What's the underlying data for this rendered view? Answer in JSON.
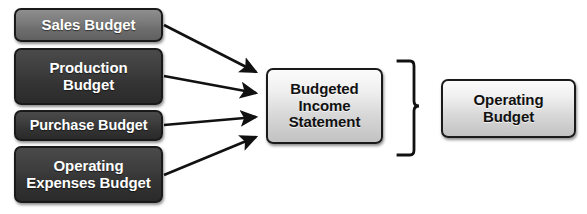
{
  "diagram": {
    "colors": {
      "node_gray_mid": "#7c7c7c",
      "node_gray_dark": "#3a3a3a",
      "node_light": "#dedede",
      "outline": "#1a1a1a",
      "connector": "#111111",
      "background": "#ffffff"
    },
    "inputs": [
      {
        "id": "sales",
        "label": "Sales Budget",
        "shade": "gray-mid"
      },
      {
        "id": "production",
        "label": "Production\nBudget",
        "shade": "gray-dark"
      },
      {
        "id": "purchase",
        "label": "Purchase Budget",
        "shade": "gray-dark"
      },
      {
        "id": "operating_expenses",
        "label": "Operating\nExpenses Budget",
        "shade": "gray-dark"
      }
    ],
    "center": {
      "id": "budgeted_income_statement",
      "label": "Budgeted\nIncome\nStatement"
    },
    "output": {
      "id": "operating_budget",
      "label": "Operating\nBudget"
    },
    "connectors": {
      "arrow_count": 4,
      "arrow_style": "solid-filled-head",
      "brace_style": "right-facing-curly-brace",
      "brace_label": ""
    }
  }
}
